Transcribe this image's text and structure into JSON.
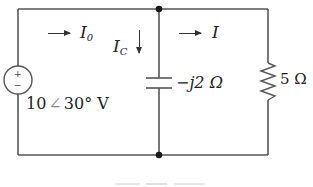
{
  "diagram": {
    "type": "ac-circuit",
    "source": {
      "label_magnitude": "10",
      "label_angle_symbol": "∠",
      "label_angle": "30°",
      "label_unit": "V",
      "polarity_top": "+",
      "polarity_bottom": "−"
    },
    "currents": {
      "source_current": {
        "symbol": "I",
        "subscript": "0",
        "direction": "right"
      },
      "capacitor_current": {
        "symbol": "I",
        "subscript": "C",
        "direction": "down"
      },
      "load_current": {
        "symbol": "I",
        "subscript": "",
        "direction": "right"
      }
    },
    "capacitor": {
      "label": "−j2 Ω"
    },
    "resistor": {
      "label": "5 Ω"
    },
    "nodes": [
      "top-middle",
      "bottom-middle"
    ],
    "colors": {
      "wire": "#555555",
      "node": "#1a1a1a",
      "text": "#222222",
      "background": "#ffffff"
    }
  }
}
